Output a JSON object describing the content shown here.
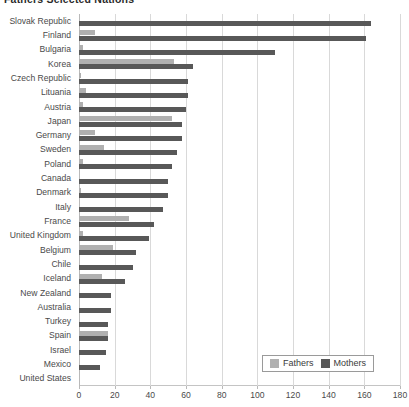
{
  "chart_data": {
    "type": "bar",
    "orientation": "horizontal",
    "title": "Fathers   Selected Nations",
    "xlabel": "",
    "ylabel": "",
    "xlim": [
      0,
      180
    ],
    "xticks": [
      0,
      20,
      40,
      60,
      80,
      100,
      120,
      140,
      160,
      180
    ],
    "grid": true,
    "legend_position": "bottom-right",
    "colors": {
      "fathers": "#b0b0b0",
      "mothers": "#585858",
      "gridline": "#d9d9d9",
      "text": "#4a4a4a"
    },
    "categories": [
      "Slovak Republic",
      "Finland",
      "Bulgaria",
      "Korea",
      "Czech Republic",
      "Lituania",
      "Austria",
      "Japan",
      "Germany",
      "Sweden",
      "Poland",
      "Canada",
      "Denmark",
      "Italy",
      "France",
      "United Kingdom",
      "Belgium",
      "Chile",
      "Iceland",
      "New Zealand",
      "Australia",
      "Turkey",
      "Spain",
      "Israel",
      "Mexico",
      "United States"
    ],
    "series": [
      {
        "name": "Fathers",
        "color": "#b0b0b0",
        "values": [
          0,
          9,
          2,
          53,
          1,
          4,
          2,
          52,
          9,
          14,
          2,
          0,
          1,
          0,
          28,
          2,
          19,
          0,
          13,
          0,
          0,
          0,
          16,
          0,
          0,
          0
        ]
      },
      {
        "name": "Mothers",
        "color": "#585858",
        "values": [
          164,
          161,
          110,
          64,
          61,
          61,
          60,
          58,
          58,
          55,
          52,
          50,
          50,
          47,
          42,
          39,
          32,
          30,
          26,
          18,
          18,
          16,
          16,
          15,
          12,
          0
        ]
      }
    ]
  },
  "legend": {
    "entries": [
      {
        "label": "Fathers",
        "key": "fathers"
      },
      {
        "label": "Mothers",
        "key": "mothers"
      }
    ]
  }
}
